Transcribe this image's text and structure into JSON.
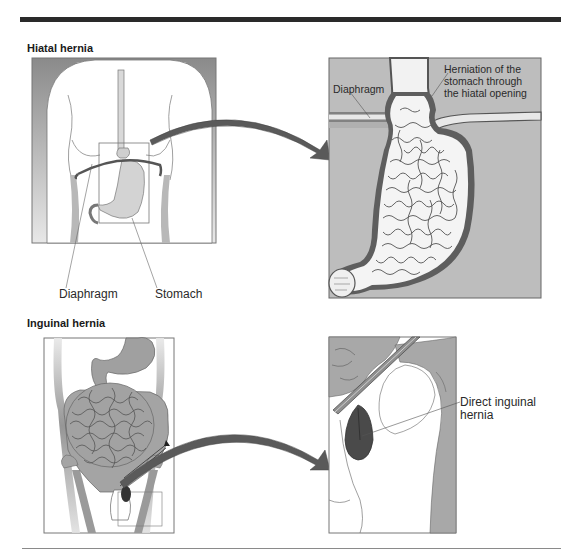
{
  "figure": {
    "sections": [
      {
        "title": "Hiatal hernia",
        "left_panel": {
          "labels": [
            "Diaphragm",
            "Stomach"
          ]
        },
        "right_panel": {
          "labels": {
            "diaphragm": "Diaphragm",
            "herniation": [
              "Herniation of the",
              "stomach through",
              "the hiatal opening"
            ]
          }
        }
      },
      {
        "title": "Inguinal hernia",
        "left_panel": {
          "labels": []
        },
        "right_panel": {
          "labels": {
            "hernia": [
              "Direct inguinal",
              "hernia"
            ]
          }
        }
      }
    ],
    "colors": {
      "rule": "#2a2a2a",
      "tissue_gray": "#9a9a9a",
      "dark_gray": "#555555",
      "light_fill": "#d6d6d6",
      "background_gray": "#bdbdbd",
      "arrow": "#5a5a5a",
      "hernia_sac": "#4a4a4a"
    }
  }
}
